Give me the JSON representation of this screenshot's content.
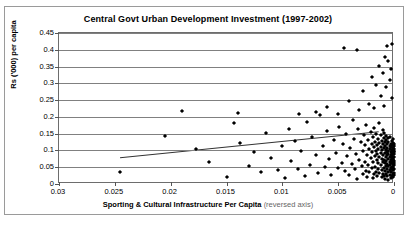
{
  "chart_data": {
    "type": "scatter",
    "title": "Central Govt Urban Development Investment (1997-2002)",
    "xlabel_main": "Sporting & Cultural Infrastructure Per Capita",
    "xlabel_sub": "(reversed axis)",
    "ylabel": "Rs ('000) per capita",
    "xlim": [
      0.03,
      0.0
    ],
    "ylim": [
      0,
      0.45
    ],
    "x_reversed": true,
    "grid": "horizontal",
    "legend": "none",
    "marker": "diamond",
    "marker_color": "#000000",
    "xticks": [
      0.03,
      0.025,
      0.02,
      0.015,
      0.01,
      0.005,
      0
    ],
    "xtick_labels": [
      "0.03",
      "0.025",
      "0.02",
      "0.015",
      "0.01",
      "0.005",
      "0"
    ],
    "yticks": [
      0,
      0.05,
      0.1,
      0.15,
      0.2,
      0.25,
      0.3,
      0.35,
      0.4,
      0.45
    ],
    "ytick_labels": [
      "0",
      "0.05",
      "0.1",
      "0.15",
      "0.2",
      "0.25",
      "0.3",
      "0.35",
      "0.4",
      "0.45"
    ],
    "trendline": {
      "x0": 0.0245,
      "y0": 0.073,
      "x1": 0.0012,
      "y1": 0.152,
      "color": "#333333"
    },
    "points": [
      [
        0.0245,
        0.037
      ],
      [
        0.0205,
        0.143
      ],
      [
        0.0177,
        0.104
      ],
      [
        0.0166,
        0.067
      ],
      [
        0.015,
        0.021
      ],
      [
        0.0143,
        0.183
      ],
      [
        0.0138,
        0.121
      ],
      [
        0.013,
        0.055
      ],
      [
        0.0125,
        0.094
      ],
      [
        0.0119,
        0.036
      ],
      [
        0.0115,
        0.152
      ],
      [
        0.011,
        0.078
      ],
      [
        0.0104,
        0.041
      ],
      [
        0.01,
        0.113
      ],
      [
        0.0098,
        0.019
      ],
      [
        0.0094,
        0.165
      ],
      [
        0.0092,
        0.069
      ],
      [
        0.0089,
        0.128
      ],
      [
        0.0086,
        0.045
      ],
      [
        0.0083,
        0.097
      ],
      [
        0.008,
        0.024
      ],
      [
        0.0078,
        0.186
      ],
      [
        0.0075,
        0.058
      ],
      [
        0.0073,
        0.139
      ],
      [
        0.007,
        0.086
      ],
      [
        0.0068,
        0.033
      ],
      [
        0.0066,
        0.205
      ],
      [
        0.0064,
        0.112
      ],
      [
        0.0062,
        0.051
      ],
      [
        0.006,
        0.158
      ],
      [
        0.0058,
        0.075
      ],
      [
        0.0056,
        0.028
      ],
      [
        0.0054,
        0.131
      ],
      [
        0.0052,
        0.093
      ],
      [
        0.005,
        0.047
      ],
      [
        0.0049,
        0.171
      ],
      [
        0.0047,
        0.064
      ],
      [
        0.0046,
        0.119
      ],
      [
        0.0044,
        0.038
      ],
      [
        0.0043,
        0.148
      ],
      [
        0.0042,
        0.082
      ],
      [
        0.004,
        0.026
      ],
      [
        0.0039,
        0.107
      ],
      [
        0.0038,
        0.061
      ],
      [
        0.0037,
        0.192
      ],
      [
        0.0036,
        0.135
      ],
      [
        0.0035,
        0.044
      ],
      [
        0.0034,
        0.089
      ],
      [
        0.0033,
        0.016
      ],
      [
        0.0032,
        0.163
      ],
      [
        0.0031,
        0.072
      ],
      [
        0.003,
        0.124
      ],
      [
        0.0029,
        0.053
      ],
      [
        0.0028,
        0.099
      ],
      [
        0.0028,
        0.031
      ],
      [
        0.0027,
        0.145
      ],
      [
        0.0026,
        0.067
      ],
      [
        0.0026,
        0.115
      ],
      [
        0.0025,
        0.04
      ],
      [
        0.0025,
        0.177
      ],
      [
        0.0024,
        0.085
      ],
      [
        0.0024,
        0.022
      ],
      [
        0.0023,
        0.132
      ],
      [
        0.0023,
        0.058
      ],
      [
        0.0022,
        0.103
      ],
      [
        0.0022,
        0.035
      ],
      [
        0.0021,
        0.156
      ],
      [
        0.0021,
        0.077
      ],
      [
        0.002,
        0.12
      ],
      [
        0.002,
        0.048
      ],
      [
        0.002,
        0.095
      ],
      [
        0.0019,
        0.018
      ],
      [
        0.0019,
        0.141
      ],
      [
        0.0019,
        0.066
      ],
      [
        0.0018,
        0.11
      ],
      [
        0.0018,
        0.029
      ],
      [
        0.0018,
        0.168
      ],
      [
        0.0017,
        0.083
      ],
      [
        0.0017,
        0.126
      ],
      [
        0.0017,
        0.052
      ],
      [
        0.0016,
        0.098
      ],
      [
        0.0016,
        0.037
      ],
      [
        0.0016,
        0.15
      ],
      [
        0.0015,
        0.071
      ],
      [
        0.0015,
        0.117
      ],
      [
        0.0015,
        0.025
      ],
      [
        0.0015,
        0.088
      ],
      [
        0.0014,
        0.134
      ],
      [
        0.0014,
        0.045
      ],
      [
        0.0014,
        0.105
      ],
      [
        0.0014,
        0.062
      ],
      [
        0.0013,
        0.181
      ],
      [
        0.0013,
        0.079
      ],
      [
        0.0013,
        0.122
      ],
      [
        0.0013,
        0.033
      ],
      [
        0.0012,
        0.093
      ],
      [
        0.0012,
        0.147
      ],
      [
        0.0012,
        0.056
      ],
      [
        0.0012,
        0.111
      ],
      [
        0.0011,
        0.02
      ],
      [
        0.0011,
        0.074
      ],
      [
        0.0011,
        0.129
      ],
      [
        0.0011,
        0.042
      ],
      [
        0.0011,
        0.1
      ],
      [
        0.001,
        0.16
      ],
      [
        0.001,
        0.067
      ],
      [
        0.001,
        0.118
      ],
      [
        0.001,
        0.03
      ],
      [
        0.001,
        0.086
      ],
      [
        0.0009,
        0.138
      ],
      [
        0.0009,
        0.049
      ],
      [
        0.0009,
        0.106
      ],
      [
        0.0009,
        0.073
      ],
      [
        0.0009,
        0.024
      ],
      [
        0.0009,
        0.152
      ],
      [
        0.0008,
        0.091
      ],
      [
        0.0008,
        0.124
      ],
      [
        0.0008,
        0.038
      ],
      [
        0.0008,
        0.064
      ],
      [
        0.0008,
        0.112
      ],
      [
        0.0008,
        0.016
      ],
      [
        0.0007,
        0.143
      ],
      [
        0.0007,
        0.081
      ],
      [
        0.0007,
        0.053
      ],
      [
        0.0007,
        0.102
      ],
      [
        0.0007,
        0.029
      ],
      [
        0.0007,
        0.131
      ],
      [
        0.0007,
        0.07
      ],
      [
        0.0006,
        0.095
      ],
      [
        0.0006,
        0.045
      ],
      [
        0.0006,
        0.119
      ],
      [
        0.0006,
        0.061
      ],
      [
        0.0006,
        0.023
      ],
      [
        0.0006,
        0.108
      ],
      [
        0.0006,
        0.085
      ],
      [
        0.0005,
        0.136
      ],
      [
        0.0005,
        0.035
      ],
      [
        0.0005,
        0.074
      ],
      [
        0.0005,
        0.099
      ],
      [
        0.0005,
        0.055
      ],
      [
        0.0005,
        0.013
      ],
      [
        0.0005,
        0.125
      ],
      [
        0.0005,
        0.09
      ],
      [
        0.0004,
        0.065
      ],
      [
        0.0004,
        0.042
      ],
      [
        0.0004,
        0.113
      ],
      [
        0.0004,
        0.08
      ],
      [
        0.0004,
        0.027
      ],
      [
        0.0004,
        0.104
      ],
      [
        0.0004,
        0.058
      ],
      [
        0.0004,
        0.141
      ],
      [
        0.0003,
        0.072
      ],
      [
        0.0003,
        0.094
      ],
      [
        0.0003,
        0.048
      ],
      [
        0.0003,
        0.12
      ],
      [
        0.0003,
        0.019
      ],
      [
        0.0003,
        0.086
      ],
      [
        0.0003,
        0.063
      ],
      [
        0.0003,
        0.11
      ],
      [
        0.0003,
        0.037
      ],
      [
        0.0002,
        0.078
      ],
      [
        0.0002,
        0.1
      ],
      [
        0.0002,
        0.052
      ],
      [
        0.0002,
        0.128
      ],
      [
        0.0002,
        0.068
      ],
      [
        0.0002,
        0.025
      ],
      [
        0.0002,
        0.091
      ],
      [
        0.0002,
        0.044
      ],
      [
        0.0002,
        0.115
      ],
      [
        0.0002,
        0.083
      ],
      [
        0.0001,
        0.059
      ],
      [
        0.0001,
        0.031
      ],
      [
        0.0001,
        0.106
      ],
      [
        0.0001,
        0.075
      ],
      [
        0.0001,
        0.096
      ],
      [
        0.0001,
        0.05
      ],
      [
        0.0001,
        0.134
      ],
      [
        0.0001,
        0.066
      ],
      [
        0.0001,
        0.021
      ],
      [
        0.0001,
        0.088
      ],
      [
        0.0001,
        0.041
      ],
      [
        0.0001,
        0.122
      ],
      [
        0.0001,
        0.071
      ],
      [
        0.0,
        0.097
      ],
      [
        0.0,
        0.056
      ],
      [
        0.0,
        0.112
      ],
      [
        0.0,
        0.033
      ],
      [
        0.0,
        0.08
      ],
      [
        0.0,
        0.062
      ],
      [
        0.0,
        0.103
      ],
      [
        0.0,
        0.046
      ],
      [
        0.0,
        0.089
      ],
      [
        0.0,
        0.027
      ],
      [
        0.0,
        0.118
      ],
      [
        0.0,
        0.07
      ],
      [
        0.0,
        0.094
      ],
      [
        0.0045,
        0.404
      ],
      [
        0.0033,
        0.4
      ],
      [
        0.0006,
        0.412
      ],
      [
        0.0002,
        0.418
      ],
      [
        0.0008,
        0.378
      ],
      [
        0.0005,
        0.366
      ],
      [
        0.0013,
        0.352
      ],
      [
        0.0003,
        0.344
      ],
      [
        0.001,
        0.33
      ],
      [
        0.002,
        0.318
      ],
      [
        0.0004,
        0.31
      ],
      [
        0.0016,
        0.296
      ],
      [
        0.0007,
        0.288
      ],
      [
        0.0028,
        0.276
      ],
      [
        0.0012,
        0.262
      ],
      [
        0.0002,
        0.256
      ],
      [
        0.004,
        0.248
      ],
      [
        0.0022,
        0.238
      ],
      [
        0.0009,
        0.232
      ],
      [
        0.006,
        0.228
      ],
      [
        0.0031,
        0.222
      ],
      [
        0.007,
        0.214
      ],
      [
        0.005,
        0.208
      ],
      [
        0.0018,
        0.226
      ],
      [
        0.0085,
        0.21
      ],
      [
        0.014,
        0.212
      ],
      [
        0.019,
        0.218
      ]
    ]
  }
}
